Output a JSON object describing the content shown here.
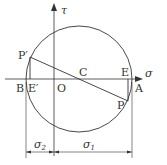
{
  "diagram": {
    "type": "mohr-circle",
    "axes": {
      "horizontal_label": "σ",
      "vertical_label": "τ"
    },
    "points": {
      "origin": "O",
      "center": "C",
      "left_intercept": "B",
      "right_intercept": "A",
      "upper_point": "P′",
      "lower_point": "P",
      "upper_foot": "E′",
      "lower_foot": "E"
    },
    "dimensions": {
      "left": {
        "symbol": "σ",
        "subscript": "2"
      },
      "right": {
        "symbol": "σ",
        "subscript": "1"
      }
    },
    "colors": {
      "stroke": "#333333",
      "background": "#ffffff"
    }
  }
}
